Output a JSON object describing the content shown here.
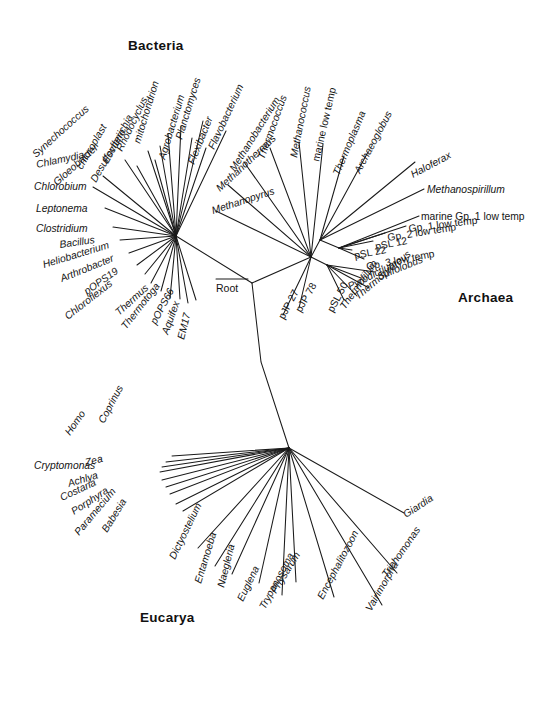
{
  "figure": {
    "type": "phylogenetic-tree",
    "background_color": "#ffffff",
    "line_color": "#1a1a1a",
    "root_label": "Root"
  },
  "domains": [
    {
      "id": "bacteria",
      "label": "Bacteria",
      "x": 128,
      "y": 50
    },
    {
      "id": "archaea",
      "label": "Archaea",
      "x": 458,
      "y": 302
    },
    {
      "id": "eucarya",
      "label": "Eucarya",
      "x": 140,
      "y": 622
    }
  ],
  "nodes": {
    "root": {
      "x": 252,
      "y": 283
    },
    "bacteria": {
      "x": 176,
      "y": 236
    },
    "archaea": {
      "x": 311,
      "y": 257
    },
    "eucarya": {
      "x": 289,
      "y": 448
    },
    "archaea_upper": {
      "x": 320,
      "y": 240
    },
    "archaea_crown": {
      "x": 339,
      "y": 248
    },
    "archaea_cren": {
      "x": 327,
      "y": 265
    }
  },
  "chart_data": {
    "type": "tree",
    "groups": {
      "bacteria": {
        "label": "Bacteria",
        "hub": [
          176,
          236
        ],
        "taxa": [
          {
            "name": "Chlorobium",
            "tip": [
              93,
              187
            ],
            "label_x": 34,
            "label_y": 190,
            "angle": 0,
            "anchor": "start",
            "italic": true
          },
          {
            "name": "Chlamydia",
            "tip": [
              103,
              176
            ],
            "label_x": 37,
            "label_y": 168,
            "angle": -12,
            "anchor": "start",
            "italic": true
          },
          {
            "name": "Synechococcus",
            "tip": [
              125,
              160
            ],
            "label_x": 36,
            "label_y": 158,
            "angle": -42,
            "anchor": "start",
            "italic": true
          },
          {
            "name": "Gloeobacter",
            "tip": [
              137,
              166
            ],
            "label_x": 57,
            "label_y": 186,
            "angle": -42,
            "anchor": "start",
            "italic": true
          },
          {
            "name": "chloroplast",
            "tip": [
              148,
              151
            ],
            "label_x": 82,
            "label_y": 170,
            "angle": -60,
            "anchor": "start",
            "italic": true
          },
          {
            "name": "Desulfovibrio",
            "tip": [
              155,
              160
            ],
            "label_x": 96,
            "label_y": 183,
            "angle": -60,
            "anchor": "start",
            "italic": true
          },
          {
            "name": "Escherichia",
            "tip": [
              160,
              146
            ],
            "label_x": 108,
            "label_y": 164,
            "angle": -62,
            "anchor": "start",
            "italic": true
          },
          {
            "name": "Rhodocyclus",
            "tip": [
              168,
              134
            ],
            "label_x": 122,
            "label_y": 152,
            "angle": -64,
            "anchor": "start",
            "italic": true
          },
          {
            "name": "mitochondrion",
            "tip": [
              181,
              126
            ],
            "label_x": 140,
            "label_y": 144,
            "angle": -73,
            "anchor": "start",
            "italic": true
          },
          {
            "name": "Agrobacterium",
            "tip": [
              192,
              138
            ],
            "label_x": 165,
            "label_y": 160,
            "angle": -73,
            "anchor": "start",
            "italic": true
          },
          {
            "name": "Planctomyces",
            "tip": [
              203,
              121
            ],
            "label_x": 182,
            "label_y": 140,
            "angle": -73,
            "anchor": "start",
            "italic": true
          },
          {
            "name": "Flexibacter",
            "tip": [
              206,
              148
            ],
            "label_x": 194,
            "label_y": 165,
            "angle": -68,
            "anchor": "start",
            "italic": true
          },
          {
            "name": "Flavobacterium",
            "tip": [
              226,
              131
            ],
            "label_x": 214,
            "label_y": 150,
            "angle": -65,
            "anchor": "start",
            "italic": true
          },
          {
            "name": "Leptonema",
            "tip": [
              105,
              208
            ],
            "label_x": 36,
            "label_y": 212,
            "angle": 0,
            "anchor": "start",
            "italic": true
          },
          {
            "name": "Clostridium",
            "tip": [
              113,
              227
            ],
            "label_x": 36,
            "label_y": 232,
            "angle": 0,
            "anchor": "start",
            "italic": true
          },
          {
            "name": "Bacillus",
            "tip": [
              120,
              240
            ],
            "label_x": 60,
            "label_y": 248,
            "angle": -8,
            "anchor": "start",
            "italic": true
          },
          {
            "name": "Heliobacterium",
            "tip": [
              129,
              253
            ],
            "label_x": 44,
            "label_y": 268,
            "angle": -17,
            "anchor": "start",
            "italic": true
          },
          {
            "name": "Arthrobacter",
            "tip": [
              137,
              265
            ],
            "label_x": 62,
            "label_y": 282,
            "angle": -22,
            "anchor": "start",
            "italic": true
          },
          {
            "name": "pOPS19",
            "tip": [
              145,
              274
            ],
            "label_x": 87,
            "label_y": 295,
            "angle": -35,
            "anchor": "start",
            "italic": true
          },
          {
            "name": "Chloroflexus",
            "tip": [
              151,
              283
            ],
            "label_x": 68,
            "label_y": 320,
            "angle": -38,
            "anchor": "start",
            "italic": true
          },
          {
            "name": "Thermus",
            "tip": [
              161,
              291
            ],
            "label_x": 119,
            "label_y": 316,
            "angle": -42,
            "anchor": "start",
            "italic": true
          },
          {
            "name": "Thermotoga",
            "tip": [
              170,
              298
            ],
            "label_x": 126,
            "label_y": 330,
            "angle": -52,
            "anchor": "start",
            "italic": true
          },
          {
            "name": "pOPS66",
            "tip": [
              180,
              299
            ],
            "label_x": 156,
            "label_y": 325,
            "angle": -62,
            "anchor": "start",
            "italic": true
          },
          {
            "name": "Aquifex",
            "tip": [
              188,
              303
            ],
            "label_x": 168,
            "label_y": 335,
            "angle": -70,
            "anchor": "start",
            "italic": true
          },
          {
            "name": "EM17",
            "tip": [
              196,
              300
            ],
            "label_x": 184,
            "label_y": 340,
            "angle": -76,
            "anchor": "start",
            "italic": true
          }
        ]
      },
      "archaea": {
        "label": "Archaea",
        "hub": [
          311,
          257
        ],
        "taxa": [
          {
            "name": "Methanopyrus",
            "tip": [
              216,
              211
            ],
            "label_x": 213,
            "label_y": 214,
            "angle": -18,
            "anchor": "start",
            "italic": true
          },
          {
            "name": "Methanothermus",
            "tip": [
              228,
              185
            ],
            "label_x": 220,
            "label_y": 192,
            "angle": -43,
            "anchor": "start",
            "italic": true
          },
          {
            "name": "Methanobacterium",
            "tip": [
              244,
              162
            ],
            "label_x": 235,
            "label_y": 172,
            "angle": -58,
            "anchor": "start",
            "italic": true
          },
          {
            "name": "Thermococcus",
            "tip": [
              270,
              148
            ],
            "label_x": 264,
            "label_y": 160,
            "angle": -70,
            "anchor": "start",
            "italic": true
          },
          {
            "name": "Methanococcus",
            "tip": [
              299,
              142
            ],
            "label_x": 297,
            "label_y": 158,
            "angle": -79,
            "anchor": "start",
            "italic": true
          },
          {
            "name": "marine low temp",
            "tip": [
              323,
              144
            ],
            "label_x": 319,
            "label_y": 162,
            "angle": -77,
            "anchor": "start",
            "italic": false
          },
          {
            "name": "Thermoplasma",
            "tip": [
              344,
              156
            ],
            "label_x": 339,
            "label_y": 176,
            "angle": -67,
            "anchor": "start",
            "italic": true
          },
          {
            "name": "Archaeoglobus",
            "tip": [
              368,
              152
            ],
            "label_x": 360,
            "label_y": 174,
            "angle": -62,
            "anchor": "start",
            "italic": true
          },
          {
            "name": "Haloferax",
            "tip": [
              415,
              162
            ],
            "label_x": 413,
            "label_y": 178,
            "angle": -28,
            "anchor": "start",
            "italic": true
          },
          {
            "name": "Methanospirillum",
            "tip": [
              424,
              189
            ],
            "label_x": 427,
            "label_y": 193,
            "angle": 0,
            "anchor": "start",
            "italic": true
          },
          {
            "name": "marine Gp. 1 low temp",
            "tip": [
              419,
              216
            ],
            "label_x": 421,
            "label_y": 220,
            "angle": 0,
            "anchor": "start",
            "italic": false
          },
          {
            "name": "Gp. 1 low temp",
            "tip": [
              406,
              226
            ],
            "label_x": 409,
            "label_y": 232,
            "angle": -7,
            "anchor": "start",
            "italic": false
          },
          {
            "name": "Gp. 2 low temp",
            "tip": [
              385,
              233
            ],
            "label_x": 388,
            "label_y": 241,
            "angle": -9,
            "anchor": "start",
            "italic": false
          },
          {
            "name": "pSL 12",
            "tip": [
              373,
              241
            ],
            "label_x": 376,
            "label_y": 250,
            "angle": -11,
            "anchor": "start",
            "italic": false
          },
          {
            "name": "pSL 22",
            "tip": [
              352,
              250
            ],
            "label_x": 355,
            "label_y": 259,
            "angle": -11,
            "anchor": "start",
            "italic": false
          },
          {
            "name": "Gp. 3 low temp",
            "tip": [
              364,
              259
            ],
            "label_x": 367,
            "label_y": 270,
            "angle": -11,
            "anchor": "start",
            "italic": false
          },
          {
            "name": "Sulfolobus",
            "tip": [
              375,
              272
            ],
            "label_x": 379,
            "label_y": 280,
            "angle": -22,
            "anchor": "start",
            "italic": true
          },
          {
            "name": "Pyrodictium",
            "tip": [
              361,
              278
            ],
            "label_x": 350,
            "label_y": 290,
            "angle": -27,
            "anchor": "start",
            "italic": true
          },
          {
            "name": "Thermoproteus",
            "tip": [
              369,
              288
            ],
            "label_x": 358,
            "label_y": 300,
            "angle": -40,
            "anchor": "start",
            "italic": true
          },
          {
            "name": "Thermofilum",
            "tip": [
              357,
              296
            ],
            "label_x": 345,
            "label_y": 310,
            "angle": -55,
            "anchor": "start",
            "italic": true
          },
          {
            "name": "pSL 50",
            "tip": [
              344,
              300
            ],
            "label_x": 333,
            "label_y": 313,
            "angle": -62,
            "anchor": "start",
            "italic": false
          },
          {
            "name": "pJP 78",
            "tip": [
              299,
              308
            ],
            "label_x": 301,
            "label_y": 313,
            "angle": -60,
            "anchor": "start",
            "italic": false
          },
          {
            "name": "pJP 27",
            "tip": [
              283,
              315
            ],
            "label_x": 284,
            "label_y": 320,
            "angle": -62,
            "anchor": "start",
            "italic": false
          }
        ]
      },
      "eucarya": {
        "label": "Eucarya",
        "hub": [
          289,
          448
        ],
        "taxa": [
          {
            "name": "Coprinus",
            "tip": [
              172,
              456
            ],
            "label_x": 104,
            "label_y": 424,
            "angle": -62,
            "anchor": "start",
            "italic": true
          },
          {
            "name": "Homo",
            "tip": [
              166,
              462
            ],
            "label_x": 70,
            "label_y": 436,
            "angle": -55,
            "anchor": "start",
            "italic": true
          },
          {
            "name": "Zea",
            "tip": [
              162,
              467
            ],
            "label_x": 86,
            "label_y": 466,
            "angle": -14,
            "anchor": "start",
            "italic": true
          },
          {
            "name": "Cryptomonas",
            "tip": [
              160,
              472
            ],
            "label_x": 34,
            "label_y": 469,
            "angle": 0,
            "anchor": "start",
            "italic": true
          },
          {
            "name": "Achlya",
            "tip": [
              162,
              480
            ],
            "label_x": 69,
            "label_y": 487,
            "angle": -17,
            "anchor": "start",
            "italic": true
          },
          {
            "name": "Costaria",
            "tip": [
              166,
              487
            ],
            "label_x": 62,
            "label_y": 501,
            "angle": -25,
            "anchor": "start",
            "italic": true
          },
          {
            "name": "Porphyra",
            "tip": [
              170,
              494
            ],
            "label_x": 74,
            "label_y": 515,
            "angle": -33,
            "anchor": "start",
            "italic": true
          },
          {
            "name": "Paramecium",
            "tip": [
              176,
              504
            ],
            "label_x": 79,
            "label_y": 536,
            "angle": -50,
            "anchor": "start",
            "italic": true
          },
          {
            "name": "Babesia",
            "tip": [
              183,
              511
            ],
            "label_x": 107,
            "label_y": 533,
            "angle": -58,
            "anchor": "start",
            "italic": true
          },
          {
            "name": "Dictyostelium",
            "tip": [
              198,
              548
            ],
            "label_x": 175,
            "label_y": 560,
            "angle": -64,
            "anchor": "start",
            "italic": true
          },
          {
            "name": "Entamoeba",
            "tip": [
              215,
              566
            ],
            "label_x": 201,
            "label_y": 584,
            "angle": -73,
            "anchor": "start",
            "italic": true
          },
          {
            "name": "Naegleria",
            "tip": [
              232,
              574
            ],
            "label_x": 224,
            "label_y": 588,
            "angle": -76,
            "anchor": "start",
            "italic": true
          },
          {
            "name": "Euglena",
            "tip": [
              259,
              583
            ],
            "label_x": 243,
            "label_y": 602,
            "angle": -64,
            "anchor": "start",
            "italic": true
          },
          {
            "name": "Trypanosoma",
            "tip": [
              282,
              595
            ],
            "label_x": 265,
            "label_y": 610,
            "angle": -62,
            "anchor": "start",
            "italic": true
          },
          {
            "name": "Physarum",
            "tip": [
              296,
              582
            ],
            "label_x": 276,
            "label_y": 594,
            "angle": -58,
            "anchor": "start",
            "italic": true
          },
          {
            "name": "Giardia",
            "tip": [
              404,
              513
            ],
            "label_x": 406,
            "label_y": 518,
            "angle": -33,
            "anchor": "start",
            "italic": true
          },
          {
            "name": "Trichomonas",
            "tip": [
              397,
              573
            ],
            "label_x": 387,
            "label_y": 578,
            "angle": -55,
            "anchor": "start",
            "italic": true
          },
          {
            "name": "Vairimorpha",
            "tip": [
              382,
              605
            ],
            "label_x": 371,
            "label_y": 612,
            "angle": -60,
            "anchor": "start",
            "italic": true
          },
          {
            "name": "Encephalitozoon",
            "tip": [
              334,
              597
            ],
            "label_x": 323,
            "label_y": 600,
            "angle": -62,
            "anchor": "start",
            "italic": true
          }
        ]
      }
    }
  }
}
